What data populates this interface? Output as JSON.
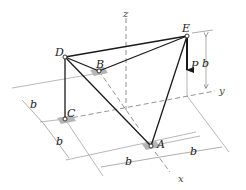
{
  "diagram": {
    "type": "space-truss",
    "joints": {
      "A": {
        "label": "A",
        "x": 151,
        "y": 146
      },
      "B": {
        "label": "B",
        "x": 99,
        "y": 71
      },
      "C": {
        "label": "C",
        "x": 65,
        "y": 119
      },
      "D": {
        "label": "D",
        "x": 65,
        "y": 57
      },
      "E": {
        "label": "E",
        "x": 187,
        "y": 36
      }
    },
    "members": [
      "DE",
      "DB",
      "BE",
      "DC",
      "DA",
      "EA"
    ],
    "load": {
      "label": "P",
      "at": "E",
      "direction": "down"
    },
    "axes": {
      "x": "x",
      "y": "y",
      "z": "z"
    },
    "dimensions": {
      "height": "b",
      "left_upper": "b",
      "left_lower": "b",
      "bottom_left": "b",
      "bottom_right": "b"
    }
  }
}
